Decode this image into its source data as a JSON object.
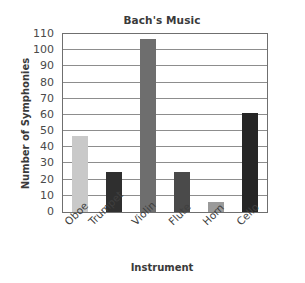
{
  "chart_data": {
    "type": "bar",
    "title": "Bach's Music",
    "xlabel": "Instrument",
    "ylabel": "Number of Symphonies",
    "categories": [
      "Oboe",
      "Trumpet",
      "Violin",
      "Flute",
      "Horn",
      "Cello"
    ],
    "values": [
      47,
      25,
      107,
      25,
      6,
      61
    ],
    "series": [
      {
        "name": "Number of Symphonies",
        "values": [
          47,
          25,
          107,
          25,
          6,
          61
        ]
      }
    ],
    "bar_colors": [
      "#c9c9c9",
      "#2f2f2f",
      "#6e6e6e",
      "#4a4a4a",
      "#9a9a9a",
      "#262626"
    ],
    "ylim": [
      0,
      110
    ],
    "ytick_step": 10,
    "yticks": [
      0,
      10,
      20,
      30,
      40,
      50,
      60,
      70,
      80,
      90,
      100,
      110
    ],
    "ytick_labels": [
      "0",
      "10",
      "20",
      "30",
      "40",
      "50",
      "60",
      "70",
      "80",
      "90",
      "100",
      "110"
    ],
    "grid": true,
    "grid_orientation": "horizontal",
    "legend": false,
    "legend_position": "none",
    "xtick_rotation": -45,
    "axis_border_color": "#6f6f6f",
    "gridline_color": "#8d8d8d",
    "plot_background": "#ffffff",
    "text_color": "#3a3a3a"
  }
}
